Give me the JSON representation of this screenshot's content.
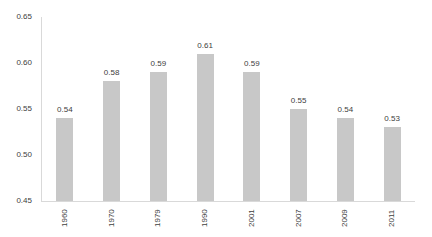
{
  "chart_data": {
    "type": "bar",
    "title": "",
    "xlabel": "",
    "ylabel": "",
    "categories": [
      "1960",
      "1970",
      "1979",
      "1990",
      "2001",
      "2007",
      "2009",
      "2011"
    ],
    "values": [
      0.54,
      0.58,
      0.59,
      0.61,
      0.59,
      0.55,
      0.54,
      0.53
    ],
    "data_labels": [
      "0.54",
      "0.58",
      "0.59",
      "0.61",
      "0.59",
      "0.55",
      "0.54",
      "0.53"
    ],
    "ylim": [
      0.45,
      0.65
    ],
    "yticks": [
      "0.45",
      "0.50",
      "0.55",
      "0.60",
      "0.65"
    ],
    "grid": false,
    "legend": null,
    "bar_color": "#c8c8c8"
  }
}
